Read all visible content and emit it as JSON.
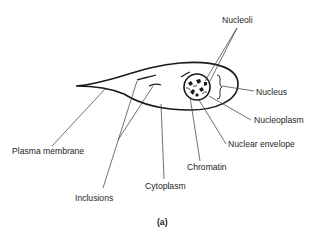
{
  "figure": {
    "caption": "(a)",
    "labels": {
      "nucleoli": "Nucleoli",
      "nucleus": "Nucleus",
      "nucleoplasm": "Nucleoplasm",
      "nuclear_envelope": "Nuclear envelope",
      "chromatin": "Chromatin",
      "cytoplasm": "Cytoplasm",
      "plasma_membrane": "Plasma membrane",
      "inclusions": "Inclusions"
    },
    "colors": {
      "outline": "#1a1a1a",
      "leader_line": "#333333",
      "background": "#ffffff"
    }
  }
}
